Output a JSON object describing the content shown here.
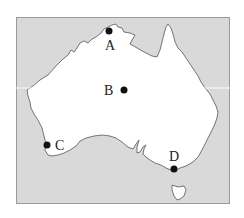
{
  "map": {
    "region": "Australia",
    "colors": {
      "ocean": "#d9d9d9",
      "land": "#ffffff",
      "coastline": "#555555",
      "frame": "#9a9a9a",
      "marker": "#111111",
      "guide_line": "#ffffff"
    },
    "points": [
      {
        "id": "A",
        "label": "A",
        "x": 109,
        "y": 31,
        "label_x": 110,
        "label_y": 50
      },
      {
        "id": "B",
        "label": "B",
        "x": 124,
        "y": 90,
        "label_x": 110,
        "label_y": 95
      },
      {
        "id": "C",
        "label": "C",
        "x": 47,
        "y": 145,
        "label_x": 60,
        "label_y": 150
      },
      {
        "id": "D",
        "label": "D",
        "x": 174,
        "y": 169,
        "label_x": 174,
        "label_y": 161
      }
    ]
  }
}
